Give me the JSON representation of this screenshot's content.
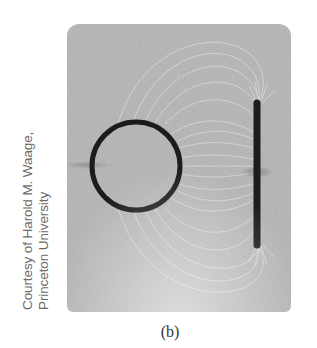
{
  "figure": {
    "label": "(b)",
    "credit_lines": [
      "Courtesy of Harold M. Waage,",
      "Princeton University"
    ],
    "photo": {
      "description": "Electric field lines (grass seeds/fibers) between a charged ring and a charged straight bar",
      "colors": {
        "background": "#bdbdbd",
        "field_lines": "#e6e6e6",
        "conductor": "#1c1c1c"
      },
      "objects": [
        {
          "name": "ring-conductor",
          "cx": 69,
          "cy": 142,
          "r": 44
        },
        {
          "name": "bar-conductor",
          "x": 190,
          "y1": 78,
          "y2": 222
        }
      ]
    }
  }
}
